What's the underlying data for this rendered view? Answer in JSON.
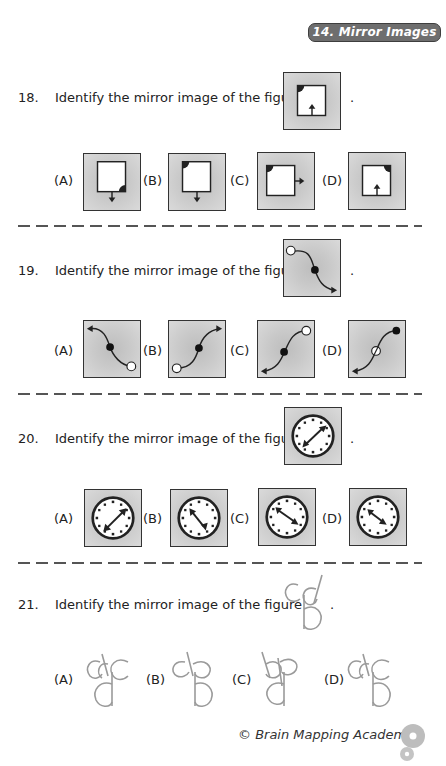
{
  "header": {
    "chapter_tag": "14. Mirror Images"
  },
  "questions": [
    {
      "number": "18.",
      "prompt": "Identify the mirror image of the figure",
      "end_punct": ".",
      "figure": "square-with-corner-quarter-circle-top-left-arrow-up-bottom",
      "options": [
        {
          "label": "(A)",
          "figure": "square quarter-circle bottom-right, arrow down below"
        },
        {
          "label": "(B)",
          "figure": "square quarter-circle top-left, arrow down below"
        },
        {
          "label": "(C)",
          "figure": "square quarter-circle top-left, arrow right"
        },
        {
          "label": "(D)",
          "figure": "square quarter-circle top-right, arrow up inside bottom"
        }
      ]
    },
    {
      "number": "19.",
      "prompt": "Identify the mirror image of the figure",
      "end_punct": ".",
      "figure": "s-curve white dot top-left, black dot center, arrow bottom-right",
      "options": [
        {
          "label": "(A)",
          "figure": "arrow top-left, black dot center, white dot bottom-right"
        },
        {
          "label": "(B)",
          "figure": "white dot bottom-left, black dot center, arrow top-right"
        },
        {
          "label": "(C)",
          "figure": "white dot top-right, black dot center, arrow bottom-left"
        },
        {
          "label": "(D)",
          "figure": "black dot top-right, white crossed dot center, arrow bottom-left"
        }
      ]
    },
    {
      "number": "20.",
      "prompt": "Identify the mirror image of the figure",
      "end_punct": ".",
      "figure": "clock with double arrow from bottom-left to top-right",
      "options": [
        {
          "label": "(A)",
          "figure": "clock double arrow bottom-left to top-right"
        },
        {
          "label": "(B)",
          "figure": "clock double arrow top-left to bottom-right (long lower)"
        },
        {
          "label": "(C)",
          "figure": "clock double arrow top-left to bottom-right"
        },
        {
          "label": "(D)",
          "figure": "clock double arrow top-left to bottom-right (short)"
        }
      ]
    },
    {
      "number": "21.",
      "prompt": "Identify the mirror image of the figure",
      "end_punct": ".",
      "figure": "letters cd over b",
      "options": [
        {
          "label": "(A)",
          "figure": "letters dc over d"
        },
        {
          "label": "(B)",
          "figure": "letters d-reversed-c over b"
        },
        {
          "label": "(C)",
          "figure": "letters bp over d"
        },
        {
          "label": "(D)",
          "figure": "letters dc over b"
        }
      ]
    }
  ],
  "footer": {
    "copyright": "© Brain Mapping Academy"
  }
}
